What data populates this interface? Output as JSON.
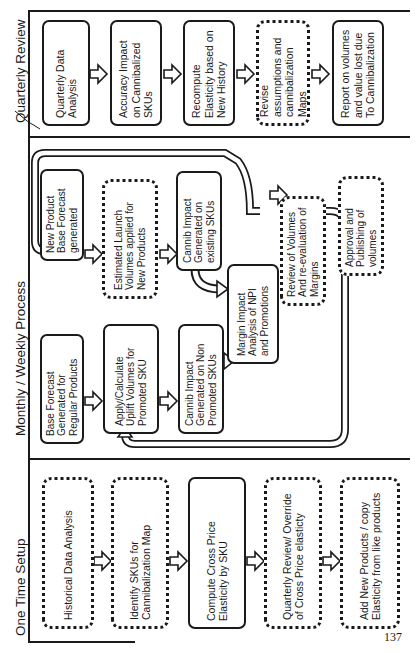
{
  "lanes": [
    {
      "title": "One Time Setup"
    },
    {
      "title": "Monthly / Weekly Process"
    },
    {
      "title": "Quarterly Review"
    }
  ],
  "one_time_setup": [
    {
      "text": "Historical Data Analysis",
      "style": "dotted"
    },
    {
      "text": "Identify SKUs for Cannibalization Map",
      "style": "dotted"
    },
    {
      "text": "Compute Cross Price Elasticity by SKU",
      "style": "solid"
    },
    {
      "text": "Quarterly Review/ Override of Cross Price elasticty",
      "style": "dotted"
    },
    {
      "text": "Add New Products / copy Elasticity from like products",
      "style": "dotted"
    }
  ],
  "monthly_weekly": {
    "base_forecast_regular": "Base Forecast Generated for Regular Products",
    "uplift_promoted": "Apply/Calculate Uplift Volumes for Promoted SKU",
    "cannib_non_promoted": "Cannib Impact Generated on Non Promoted SKUs",
    "new_product_forecast": "New Product Base Forecast generated",
    "launch_volumes": "Estimated Launch Volumes applied for New Products",
    "cannib_existing": "Cannib Impact Generated on existing SKUs",
    "margin_impact": "Margin Impact Analysis of NPI and Promotions",
    "review_volumes": "Review of Volumes And re-evaluation of Margins",
    "approval": "Approval and Publishing of volumes"
  },
  "quarterly_review": [
    {
      "text": "Quarterly Data Analysis",
      "style": "solid"
    },
    {
      "text": "Accuracy Impact on Cannibalized SKUs",
      "style": "solid"
    },
    {
      "text": "Recompute Elasticity based on New History",
      "style": "solid"
    },
    {
      "text": "Revise assumptions and cannibalization Maps",
      "style": "dotted"
    },
    {
      "text": "Report on volumes and value lost due To Cannibalization",
      "style": "solid"
    }
  ],
  "page_number": "137"
}
